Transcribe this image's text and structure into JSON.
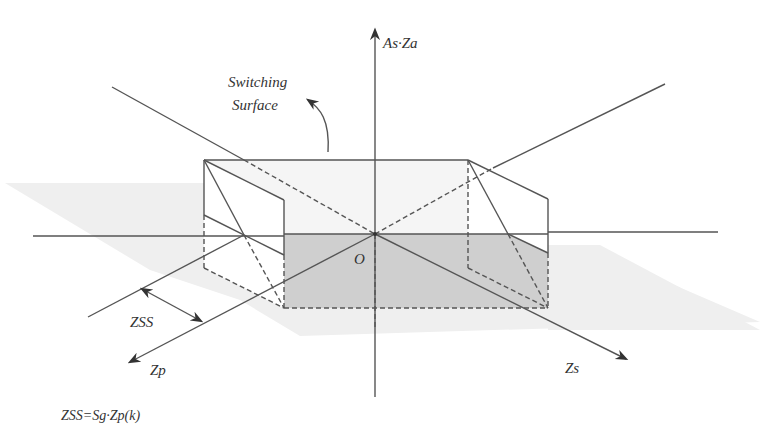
{
  "diagram": {
    "type": "3d-axes-switching-surface",
    "axes": {
      "vertical": "As·Za",
      "depth": "Zp",
      "horizontal": "Zs"
    },
    "origin_label": "O",
    "annotation": {
      "line1": "Switching",
      "line2": "Surface"
    },
    "dimension_label": "ZSS",
    "formula": "ZSS=Sg·Zp(k)",
    "colors": {
      "line": "#555555",
      "shadow_plane": "#eeeeee",
      "dark_region": "#cfcfcf",
      "top_face": "#f4f4f4"
    }
  }
}
